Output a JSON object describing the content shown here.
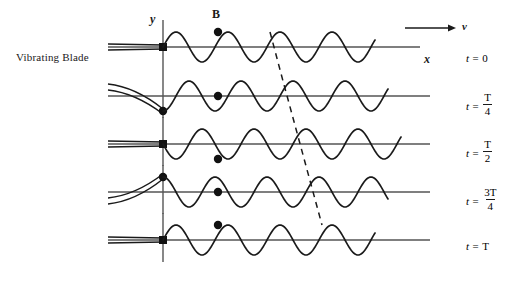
{
  "figure": {
    "title_text": "",
    "labels": {
      "source": "Vibrating Blade",
      "y_axis": "y",
      "x_axis": "x",
      "velocity": "v",
      "point_b": "B"
    },
    "colors": {
      "wave": "#1a1a1a",
      "axis": "#555555",
      "blade": "#1a1a1a",
      "dashed": "#1a1a1a",
      "marker": "#111111",
      "background": "#ffffff"
    },
    "time_labels": [
      {
        "prefix": "t =",
        "value": "0",
        "is_fraction": false,
        "numerator": "",
        "denominator": ""
      },
      {
        "prefix": "t =",
        "value": "",
        "is_fraction": true,
        "numerator": "T",
        "denominator": "4"
      },
      {
        "prefix": "t =",
        "value": "",
        "is_fraction": true,
        "numerator": "T",
        "denominator": "2"
      },
      {
        "prefix": "t =",
        "value": "",
        "is_fraction": true,
        "numerator": "3T",
        "denominator": "4"
      },
      {
        "prefix": "t =",
        "value": "T",
        "is_fraction": false,
        "numerator": "",
        "denominator": ""
      }
    ]
  },
  "chart_data": {
    "type": "line",
    "xlabel": "x",
    "ylabel": "y",
    "grid": false,
    "legend": null,
    "annotations": [
      {
        "text": "Vibrating Blade",
        "role": "source-label"
      },
      {
        "text": "B",
        "role": "tracked-particle-label"
      },
      {
        "text": "v",
        "role": "wave-velocity-arrow-label"
      }
    ],
    "wave_parameters": {
      "wavelength_px": 52,
      "amplitude_px": 15,
      "origin_x_px": 163,
      "wave_end_x_px": 375,
      "period_fractions": [
        "0",
        "T/4",
        "T/2",
        "3T/4",
        "T"
      ],
      "propagation_direction": "+x",
      "particle_b_x_px": 218
    },
    "series": [
      {
        "name": "t = 0",
        "baseline_y_px": 47,
        "phase_shift_wavelengths": 0.0,
        "wave_end_x_px": 375,
        "blade_state": "straight",
        "blade_tip_offset_px": 0,
        "particle_b_y_offset_px": -15,
        "particle_b_state": "crest",
        "crest_tracked_x_px": 270
      },
      {
        "name": "t = T/4",
        "baseline_y_px": 96,
        "phase_shift_wavelengths": 0.25,
        "wave_end_x_px": 388,
        "blade_state": "bent-down",
        "blade_tip_offset_px": 15,
        "particle_b_y_offset_px": 0,
        "particle_b_state": "zero-crossing",
        "crest_tracked_x_px": 283
      },
      {
        "name": "t = T/2",
        "baseline_y_px": 144,
        "phase_shift_wavelengths": 0.5,
        "wave_end_x_px": 401,
        "blade_state": "straight",
        "blade_tip_offset_px": 0,
        "particle_b_y_offset_px": 15,
        "particle_b_state": "trough",
        "crest_tracked_x_px": 296
      },
      {
        "name": "t = 3T/4",
        "baseline_y_px": 192,
        "phase_shift_wavelengths": 0.75,
        "wave_end_x_px": 388,
        "blade_state": "bent-up",
        "blade_tip_offset_px": -15,
        "particle_b_y_offset_px": 0,
        "particle_b_state": "zero-crossing",
        "crest_tracked_x_px": 309
      },
      {
        "name": "t = T",
        "baseline_y_px": 240,
        "phase_shift_wavelengths": 1.0,
        "wave_end_x_px": 375,
        "blade_state": "straight",
        "blade_tip_offset_px": 0,
        "particle_b_y_offset_px": -15,
        "particle_b_state": "crest",
        "crest_tracked_x_px": 322
      }
    ],
    "velocity_arrow": {
      "x_start_px": 405,
      "x_end_px": 456,
      "y_px": 28
    },
    "dashed_trace": {
      "description": "dashed line tracking one crest as it propagates in +x over one period",
      "points_px": [
        [
          270,
          32
        ],
        [
          283,
          81
        ],
        [
          296,
          129
        ],
        [
          309,
          177
        ],
        [
          322,
          225
        ]
      ]
    }
  }
}
